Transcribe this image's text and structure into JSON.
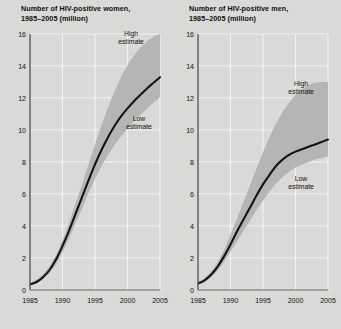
{
  "figure": {
    "background_color": "#d9d9d7",
    "band_color": "#b5b5b3",
    "line_color": "#141414",
    "grid_color": "#f2f2f0",
    "axis_color": "#6b6b6b"
  },
  "panels": [
    {
      "id": "women",
      "title": "Number of HIV-positive women,\n1985–2005 (million)",
      "annotations": {
        "high": "High\nestimate",
        "low": "Low\nestimate"
      }
    },
    {
      "id": "men",
      "title": "Number of HIV-positive men,\n1985–2005 (million)",
      "annotations": {
        "high": "High\nestimate",
        "low": "Low\nestimate"
      }
    }
  ],
  "chart_data": [
    {
      "type": "line",
      "title": "Number of HIV-positive women, 1985–2005 (million)",
      "xlabel": "",
      "ylabel": "million",
      "xlim": [
        1985,
        2005
      ],
      "ylim": [
        0,
        16
      ],
      "yticks": [
        0,
        2,
        4,
        6,
        8,
        10,
        12,
        14,
        16
      ],
      "xticks": [
        1985,
        1990,
        1995,
        2000,
        2005
      ],
      "grid": true,
      "legend": "annotations-inline",
      "annotations": [
        "High estimate",
        "Low estimate"
      ],
      "x": [
        1985,
        1986,
        1987,
        1988,
        1989,
        1990,
        1991,
        1992,
        1993,
        1994,
        1995,
        1996,
        1997,
        1998,
        1999,
        2000,
        2001,
        2002,
        2003,
        2004,
        2005
      ],
      "series": [
        {
          "name": "Best estimate",
          "values": [
            0.35,
            0.5,
            0.8,
            1.25,
            1.9,
            2.75,
            3.7,
            4.75,
            5.8,
            6.85,
            7.85,
            8.75,
            9.55,
            10.25,
            10.85,
            11.35,
            11.8,
            12.2,
            12.6,
            12.95,
            13.3
          ]
        },
        {
          "name": "High estimate",
          "values": [
            0.45,
            0.65,
            1.0,
            1.5,
            2.2,
            3.1,
            4.2,
            5.4,
            6.6,
            7.85,
            9.1,
            10.3,
            11.4,
            12.4,
            13.3,
            14.05,
            14.65,
            15.15,
            15.55,
            15.85,
            16.0
          ]
        },
        {
          "name": "Low estimate",
          "values": [
            0.3,
            0.42,
            0.68,
            1.05,
            1.6,
            2.35,
            3.2,
            4.15,
            5.1,
            6.05,
            6.95,
            7.75,
            8.45,
            9.05,
            9.6,
            10.1,
            10.55,
            10.95,
            11.35,
            11.7,
            12.05
          ]
        }
      ]
    },
    {
      "type": "line",
      "title": "Number of HIV-positive men, 1985–2005 (million)",
      "xlabel": "",
      "ylabel": "million",
      "xlim": [
        1985,
        2005
      ],
      "ylim": [
        0,
        16
      ],
      "yticks": [
        0,
        2,
        4,
        6,
        8,
        10,
        12,
        14,
        16
      ],
      "xticks": [
        1985,
        1990,
        1995,
        2000,
        2005
      ],
      "grid": true,
      "legend": "annotations-inline",
      "annotations": [
        "High estimate",
        "Low estimate"
      ],
      "x": [
        1985,
        1986,
        1987,
        1988,
        1989,
        1990,
        1991,
        1992,
        1993,
        1994,
        1995,
        1996,
        1997,
        1998,
        1999,
        2000,
        2001,
        2002,
        2003,
        2004,
        2005
      ],
      "series": [
        {
          "name": "Best estimate",
          "values": [
            0.4,
            0.6,
            0.95,
            1.45,
            2.1,
            2.85,
            3.65,
            4.4,
            5.15,
            5.9,
            6.6,
            7.2,
            7.75,
            8.15,
            8.45,
            8.65,
            8.8,
            8.95,
            9.1,
            9.25,
            9.4
          ]
        },
        {
          "name": "High estimate",
          "values": [
            0.5,
            0.75,
            1.15,
            1.75,
            2.5,
            3.45,
            4.45,
            5.5,
            6.55,
            7.6,
            8.6,
            9.55,
            10.4,
            11.1,
            11.7,
            12.2,
            12.55,
            12.8,
            12.95,
            13.0,
            13.0
          ]
        },
        {
          "name": "Low estimate",
          "values": [
            0.32,
            0.48,
            0.78,
            1.2,
            1.75,
            2.4,
            3.05,
            3.7,
            4.35,
            5.0,
            5.6,
            6.15,
            6.65,
            7.05,
            7.4,
            7.65,
            7.85,
            8.0,
            8.15,
            8.25,
            8.35
          ]
        }
      ]
    }
  ]
}
